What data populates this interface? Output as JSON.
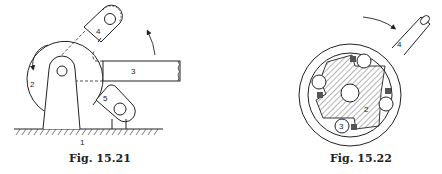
{
  "figures": [
    {
      "caption": "Fig. 15.21",
      "labels": {
        "ground": "1",
        "wheel": "2",
        "bar": "3",
        "upper_pawl": "4",
        "lower_pawl": "5"
      }
    },
    {
      "caption": "Fig. 15.22",
      "labels": {
        "hub": "2",
        "roller": "3",
        "outer_ring_arm": "4"
      }
    }
  ],
  "colors": {
    "ink": "#222222",
    "background": "#ffffff"
  }
}
